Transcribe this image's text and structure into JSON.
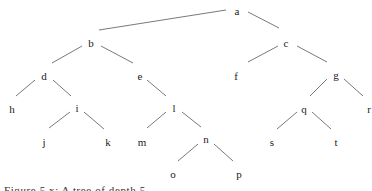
{
  "diagram": {
    "type": "tree",
    "root": "a",
    "nodes": [
      {
        "id": "a",
        "label": "a",
        "x": 237,
        "y": 12
      },
      {
        "id": "b",
        "label": "b",
        "x": 91,
        "y": 44
      },
      {
        "id": "c",
        "label": "c",
        "x": 286,
        "y": 44
      },
      {
        "id": "d",
        "label": "d",
        "x": 44,
        "y": 77
      },
      {
        "id": "e",
        "label": "e",
        "x": 140,
        "y": 77
      },
      {
        "id": "f",
        "label": "f",
        "x": 236,
        "y": 77
      },
      {
        "id": "g",
        "label": "g",
        "x": 336,
        "y": 76
      },
      {
        "id": "h",
        "label": "h",
        "x": 12,
        "y": 110
      },
      {
        "id": "i",
        "label": "i",
        "x": 77,
        "y": 109
      },
      {
        "id": "l",
        "label": "l",
        "x": 174,
        "y": 109
      },
      {
        "id": "q",
        "label": "q",
        "x": 304,
        "y": 110
      },
      {
        "id": "r",
        "label": "r",
        "x": 369,
        "y": 110
      },
      {
        "id": "j",
        "label": "j",
        "x": 44,
        "y": 143
      },
      {
        "id": "k",
        "label": "k",
        "x": 108,
        "y": 143
      },
      {
        "id": "m",
        "label": "m",
        "x": 142,
        "y": 143
      },
      {
        "id": "n",
        "label": "n",
        "x": 206,
        "y": 140
      },
      {
        "id": "s",
        "label": "s",
        "x": 272,
        "y": 143
      },
      {
        "id": "t",
        "label": "t",
        "x": 336,
        "y": 143
      },
      {
        "id": "o",
        "label": "o",
        "x": 173,
        "y": 175
      },
      {
        "id": "p",
        "label": "p",
        "x": 239,
        "y": 175
      }
    ],
    "edges": [
      {
        "from": "a",
        "to": "b",
        "x1": 99,
        "y1": 30,
        "x2": 226,
        "y2": 10
      },
      {
        "from": "a",
        "to": "c",
        "x1": 248,
        "y1": 12,
        "x2": 279,
        "y2": 28
      },
      {
        "from": "b",
        "to": "d",
        "x1": 82,
        "y1": 46,
        "x2": 52,
        "y2": 63
      },
      {
        "from": "b",
        "to": "e",
        "x1": 101,
        "y1": 46,
        "x2": 133,
        "y2": 63
      },
      {
        "from": "c",
        "to": "f",
        "x1": 278,
        "y1": 46,
        "x2": 248,
        "y2": 62
      },
      {
        "from": "c",
        "to": "g",
        "x1": 297,
        "y1": 46,
        "x2": 327,
        "y2": 62
      },
      {
        "from": "d",
        "to": "h",
        "x1": 35,
        "y1": 80,
        "x2": 16,
        "y2": 96
      },
      {
        "from": "d",
        "to": "i",
        "x1": 53,
        "y1": 80,
        "x2": 71,
        "y2": 96
      },
      {
        "from": "e",
        "to": "l",
        "x1": 147,
        "y1": 80,
        "x2": 166,
        "y2": 96
      },
      {
        "from": "g",
        "to": "q",
        "x1": 327,
        "y1": 79,
        "x2": 310,
        "y2": 96
      },
      {
        "from": "g",
        "to": "r",
        "x1": 344,
        "y1": 79,
        "x2": 363,
        "y2": 96
      },
      {
        "from": "i",
        "to": "j",
        "x1": 70,
        "y1": 112,
        "x2": 49,
        "y2": 128
      },
      {
        "from": "i",
        "to": "k",
        "x1": 84,
        "y1": 112,
        "x2": 104,
        "y2": 129
      },
      {
        "from": "l",
        "to": "m",
        "x1": 166,
        "y1": 112,
        "x2": 147,
        "y2": 128
      },
      {
        "from": "l",
        "to": "n",
        "x1": 182,
        "y1": 112,
        "x2": 201,
        "y2": 127
      },
      {
        "from": "n",
        "to": "o",
        "x1": 198,
        "y1": 144,
        "x2": 178,
        "y2": 161
      },
      {
        "from": "n",
        "to": "p",
        "x1": 214,
        "y1": 144,
        "x2": 233,
        "y2": 161
      },
      {
        "from": "q",
        "to": "s",
        "x1": 297,
        "y1": 112,
        "x2": 277,
        "y2": 129
      },
      {
        "from": "q",
        "to": "t",
        "x1": 312,
        "y1": 112,
        "x2": 331,
        "y2": 129
      }
    ]
  },
  "caption": {
    "text": "Figure 5.x: A tree of depth 5 ..."
  }
}
